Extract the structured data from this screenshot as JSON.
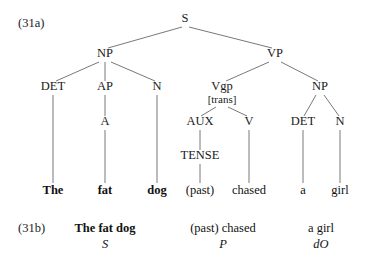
{
  "figure": {
    "type": "syntax-tree",
    "example_a_label": "(31a)",
    "example_b_label": "(31b)"
  },
  "tree": {
    "nodes": [
      {
        "id": "S",
        "label": "S",
        "x": 185,
        "y": 22,
        "style": "normal"
      },
      {
        "id": "NP1",
        "label": "NP",
        "x": 105,
        "y": 57,
        "style": "normal"
      },
      {
        "id": "VP",
        "label": "VP",
        "x": 275,
        "y": 57,
        "style": "normal"
      },
      {
        "id": "DET1",
        "label": "DET",
        "x": 53,
        "y": 90,
        "style": "normal"
      },
      {
        "id": "AP",
        "label": "AP",
        "x": 105,
        "y": 90,
        "style": "normal"
      },
      {
        "id": "N1",
        "label": "N",
        "x": 157,
        "y": 90,
        "style": "normal"
      },
      {
        "id": "Vgp",
        "label": "Vgp",
        "x": 222,
        "y": 90,
        "style": "normal"
      },
      {
        "id": "Vgpfeat",
        "label": "[trans]",
        "x": 222,
        "y": 103,
        "style": "small"
      },
      {
        "id": "NP2",
        "label": "NP",
        "x": 320,
        "y": 90,
        "style": "normal"
      },
      {
        "id": "A",
        "label": "A",
        "x": 105,
        "y": 125,
        "style": "normal"
      },
      {
        "id": "AUX",
        "label": "AUX",
        "x": 200,
        "y": 125,
        "style": "normal"
      },
      {
        "id": "V",
        "label": "V",
        "x": 249,
        "y": 125,
        "style": "normal"
      },
      {
        "id": "DET2",
        "label": "DET",
        "x": 303,
        "y": 125,
        "style": "normal"
      },
      {
        "id": "N2",
        "label": "N",
        "x": 340,
        "y": 125,
        "style": "normal"
      },
      {
        "id": "TENSE",
        "label": "TENSE",
        "x": 200,
        "y": 159,
        "style": "normal"
      }
    ],
    "edges": [
      {
        "from": "S",
        "to": "NP1",
        "x1": 182,
        "y1": 27,
        "x2": 108,
        "y2": 48
      },
      {
        "from": "S",
        "to": "VP",
        "x1": 189,
        "y1": 27,
        "x2": 272,
        "y2": 48
      },
      {
        "from": "NP1",
        "to": "DET1",
        "x1": 99,
        "y1": 62,
        "x2": 56,
        "y2": 81
      },
      {
        "from": "NP1",
        "to": "AP",
        "x1": 105,
        "y1": 62,
        "x2": 105,
        "y2": 81
      },
      {
        "from": "NP1",
        "to": "N1",
        "x1": 111,
        "y1": 62,
        "x2": 155,
        "y2": 81
      },
      {
        "from": "VP",
        "to": "Vgp",
        "x1": 269,
        "y1": 62,
        "x2": 226,
        "y2": 81
      },
      {
        "from": "VP",
        "to": "NP2",
        "x1": 281,
        "y1": 62,
        "x2": 318,
        "y2": 81
      },
      {
        "from": "Vgp",
        "to": "AUX",
        "x1": 216,
        "y1": 107,
        "x2": 201,
        "y2": 116
      },
      {
        "from": "Vgp",
        "to": "V",
        "x1": 228,
        "y1": 107,
        "x2": 247,
        "y2": 116
      },
      {
        "from": "NP2",
        "to": "DET2",
        "x1": 316,
        "y1": 95,
        "x2": 304,
        "y2": 116
      },
      {
        "from": "NP2",
        "to": "N2",
        "x1": 324,
        "y1": 95,
        "x2": 339,
        "y2": 116
      },
      {
        "from": "AP",
        "to": "A",
        "x1": 105,
        "y1": 95,
        "x2": 105,
        "y2": 116
      },
      {
        "from": "AUX",
        "to": "TENSE",
        "x1": 200,
        "y1": 130,
        "x2": 200,
        "y2": 150
      },
      {
        "from": "DET1",
        "to": "The",
        "x1": 53,
        "y1": 95,
        "x2": 53,
        "y2": 183
      },
      {
        "from": "A",
        "to": "fat",
        "x1": 105,
        "y1": 130,
        "x2": 105,
        "y2": 183
      },
      {
        "from": "N1",
        "to": "dog",
        "x1": 157,
        "y1": 95,
        "x2": 157,
        "y2": 183
      },
      {
        "from": "TENSE",
        "to": "past",
        "x1": 200,
        "y1": 164,
        "x2": 200,
        "y2": 183
      },
      {
        "from": "V",
        "to": "chased",
        "x1": 249,
        "y1": 130,
        "x2": 249,
        "y2": 183
      },
      {
        "from": "DET2",
        "to": "a",
        "x1": 303,
        "y1": 130,
        "x2": 303,
        "y2": 183
      },
      {
        "from": "N2",
        "to": "girl",
        "x1": 340,
        "y1": 130,
        "x2": 340,
        "y2": 183
      }
    ],
    "terminals": [
      {
        "id": "The",
        "label": "The",
        "x": 53,
        "y": 194,
        "bold": true
      },
      {
        "id": "fat",
        "label": "fat",
        "x": 105,
        "y": 194,
        "bold": true
      },
      {
        "id": "dog",
        "label": "dog",
        "x": 157,
        "y": 194,
        "bold": true
      },
      {
        "id": "past",
        "label": "(past)",
        "x": 200,
        "y": 194,
        "bold": false
      },
      {
        "id": "chased",
        "label": "chased",
        "x": 249,
        "y": 194,
        "bold": false
      },
      {
        "id": "a",
        "label": "a",
        "x": 303,
        "y": 194,
        "bold": false
      },
      {
        "id": "girl",
        "label": "girl",
        "x": 340,
        "y": 194,
        "bold": false
      }
    ]
  },
  "gloss": {
    "label": "(31b)",
    "label_x": 18,
    "label_y": 232,
    "groups": [
      {
        "id": "subject",
        "phrase": "The fat dog",
        "function": "S",
        "x": 105,
        "phrase_y": 232,
        "function_y": 248,
        "bold": true
      },
      {
        "id": "predicator",
        "phrase": "(past) chased",
        "function": "P",
        "x": 223,
        "phrase_y": 232,
        "function_y": 248,
        "bold": false
      },
      {
        "id": "direct-object",
        "phrase": "a girl",
        "function": "dO",
        "x": 321,
        "phrase_y": 232,
        "function_y": 248,
        "bold": false
      }
    ]
  },
  "colors": {
    "background": "#ffffff",
    "text": "#1a1a1a",
    "line": "#555555"
  }
}
